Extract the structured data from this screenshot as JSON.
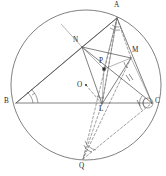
{
  "figure": {
    "background_color": "#ffffff",
    "stroke_color": "#4a4a4a",
    "dashed_color": "#6b6b6b",
    "width": 166,
    "height": 176
  },
  "circle": {
    "name": "circumcircle",
    "cx": 86,
    "cy": 85,
    "r": 75
  },
  "points": [
    {
      "id": "A",
      "label": "A",
      "x": 117,
      "y": 18,
      "label_x": 114,
      "label_y": 2,
      "marker": "none"
    },
    {
      "id": "B",
      "label": "B",
      "x": 16,
      "y": 103,
      "label_x": 4,
      "label_y": 99,
      "marker": "none"
    },
    {
      "id": "C",
      "label": "C",
      "x": 152,
      "y": 103,
      "label_x": 155,
      "label_y": 99,
      "marker": "none"
    },
    {
      "id": "N",
      "label": "N",
      "x": 82,
      "y": 47,
      "label_x": 73,
      "label_y": 37,
      "marker": "none"
    },
    {
      "id": "M",
      "label": "M",
      "x": 131,
      "y": 58,
      "label_x": 132,
      "label_y": 47,
      "marker": "none"
    },
    {
      "id": "L",
      "label": "L",
      "x": 102,
      "y": 104,
      "label_x": 99,
      "label_y": 106,
      "marker": "none"
    },
    {
      "id": "P",
      "label": "P",
      "x": 104,
      "y": 69,
      "label_x": 100,
      "label_y": 59,
      "marker": "square"
    },
    {
      "id": "O",
      "label": "O",
      "x": 86,
      "y": 85,
      "label_x": 78,
      "label_y": 83,
      "marker": "dot"
    },
    {
      "id": "Q",
      "label": "Q",
      "x": 83,
      "y": 159,
      "label_x": 79,
      "label_y": 162,
      "marker": "none"
    }
  ],
  "solid_segments": [
    {
      "name": "segment-BC",
      "from": "B",
      "to": "C"
    },
    {
      "name": "segment-BA",
      "from": "B",
      "to": "A"
    },
    {
      "name": "segment-AC",
      "from": "A",
      "to": "C"
    },
    {
      "name": "segment-NM",
      "from": "N",
      "to": "M"
    },
    {
      "name": "segment-NL",
      "from": "N",
      "to": "L"
    },
    {
      "name": "segment-ML",
      "from": "M",
      "to": "L"
    },
    {
      "name": "segment-NA",
      "from": "N",
      "to": "A"
    },
    {
      "name": "segment-NC",
      "from": "N",
      "to": "C"
    },
    {
      "name": "segment-MP",
      "from": "M",
      "to": "P"
    },
    {
      "name": "segment-NP",
      "from": "N",
      "to": "P"
    },
    {
      "name": "segment-PL",
      "from": "P",
      "to": "L"
    },
    {
      "name": "segment-BN-extended",
      "from": "B",
      "to": "N"
    }
  ],
  "dashed_segments": [
    {
      "name": "segment-AL-dashed",
      "from": "A",
      "to": "L"
    },
    {
      "name": "segment-AQ-dashed",
      "from": "A",
      "to": "Q"
    },
    {
      "name": "segment-LQ-dashed",
      "from": "L",
      "to": "Q"
    },
    {
      "name": "segment-QC-dashed",
      "from": "Q",
      "to": "C"
    },
    {
      "name": "segment-MQ-dashed",
      "from": "M",
      "to": "Q"
    },
    {
      "name": "segment-AM-dashed",
      "from": "A",
      "to": "M"
    },
    {
      "name": "segment-OL-dashed",
      "from": "O",
      "to": "L"
    }
  ],
  "angle_marks": [
    {
      "name": "angle-mark-at-B",
      "note": "double arc at vertex B between BA and BC"
    },
    {
      "name": "angle-mark-at-A",
      "note": "small double arc at vertex A"
    },
    {
      "name": "angle-mark-at-C",
      "note": "arc bundle at vertex C"
    },
    {
      "name": "angle-mark-at-Q",
      "note": "double arc above vertex Q"
    },
    {
      "name": "angle-mark-at-M",
      "note": "small arc near M"
    }
  ],
  "tick_marks": [
    {
      "name": "tick-mark-hash-right",
      "x": 128,
      "y": 78,
      "style": "double-hash"
    },
    {
      "name": "tick-mark-on-BC",
      "x": 139,
      "y": 103,
      "style": "single-hash"
    }
  ]
}
